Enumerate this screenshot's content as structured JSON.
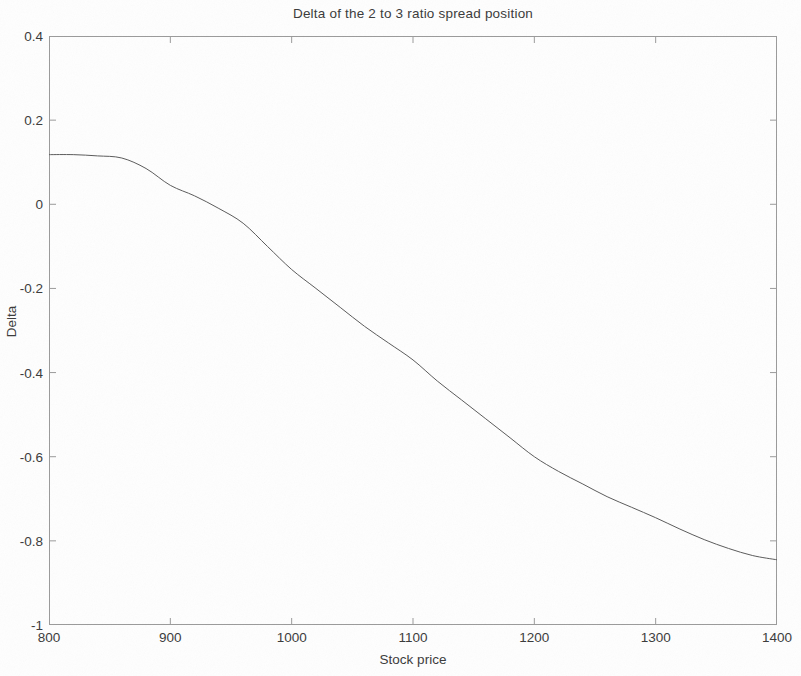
{
  "chart_data": {
    "type": "line",
    "title": "Delta of the 2 to 3 ratio spread position",
    "xlabel": "Stock price",
    "ylabel": "Delta",
    "xlim": [
      800,
      1400
    ],
    "ylim": [
      -1,
      0.4
    ],
    "xticks": [
      800,
      900,
      1000,
      1100,
      1200,
      1300,
      1400
    ],
    "xtick_labels": [
      "800",
      "900",
      "1000",
      "1100",
      "1200",
      "1300",
      "1400"
    ],
    "yticks": [
      0.4,
      0.2,
      0,
      -0.2,
      -0.4,
      -0.6,
      -0.8,
      -1
    ],
    "ytick_labels": [
      "0.4",
      "0.2",
      "0",
      "-0.2",
      "-0.4",
      "-0.6",
      "-0.8",
      "-1"
    ],
    "grid": false,
    "legend": false,
    "legend_position": "none",
    "line_color": "#5a5a5a",
    "line_width": 1.0,
    "series": [
      {
        "name": "Delta",
        "x": [
          800,
          820,
          840,
          860,
          880,
          900,
          920,
          940,
          960,
          980,
          1000,
          1020,
          1040,
          1060,
          1080,
          1100,
          1120,
          1140,
          1160,
          1180,
          1200,
          1220,
          1240,
          1260,
          1280,
          1300,
          1320,
          1340,
          1360,
          1380,
          1400
        ],
        "values": [
          0.118,
          0.118,
          0.115,
          0.11,
          0.085,
          0.045,
          0.02,
          -0.01,
          -0.045,
          -0.1,
          -0.155,
          -0.2,
          -0.245,
          -0.29,
          -0.33,
          -0.37,
          -0.42,
          -0.465,
          -0.51,
          -0.555,
          -0.6,
          -0.635,
          -0.665,
          -0.695,
          -0.72,
          -0.745,
          -0.772,
          -0.797,
          -0.818,
          -0.835,
          -0.845
        ]
      }
    ],
    "annotations": []
  },
  "figure": {
    "background_color": "#fefefe",
    "axes_color": "#9a9a9a",
    "text_color": "#3a3a3a"
  }
}
